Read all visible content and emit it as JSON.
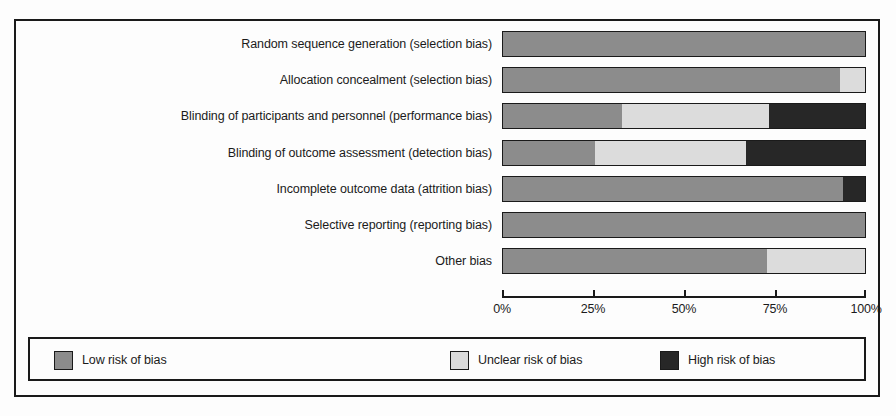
{
  "chart_data": {
    "type": "bar",
    "orientation": "horizontal",
    "stacked": true,
    "normalized_percent": true,
    "title": "",
    "xlabel": "",
    "ylabel": "",
    "xlim": [
      0,
      100
    ],
    "grid": false,
    "legend_position": "bottom",
    "categories": [
      "Random sequence generation (selection bias)",
      "Allocation concealment (selection bias)",
      "Blinding of participants and personnel (performance bias)",
      "Blinding of outcome assessment (detection bias)",
      "Incomplete outcome data (attrition bias)",
      "Selective reporting (reporting bias)",
      "Other bias"
    ],
    "series": [
      {
        "name": "Low risk of bias",
        "color": "#8c8c8c",
        "values": [
          100,
          93,
          33,
          25.5,
          94,
          100,
          73
        ]
      },
      {
        "name": "Unclear risk of bias",
        "color": "#dcdcdc",
        "values": [
          0,
          7,
          40.5,
          41.5,
          0,
          0,
          27
        ]
      },
      {
        "name": "High risk of bias",
        "color": "#272727",
        "values": [
          0,
          0,
          26.5,
          33,
          6,
          0,
          0
        ]
      }
    ],
    "xticks": [
      0,
      25,
      50,
      75,
      100
    ],
    "xtick_labels": [
      "0%",
      "25%",
      "50%",
      "75%",
      "100%"
    ]
  },
  "legend": {
    "entries": [
      {
        "label": "Low risk of bias",
        "color": "#8c8c8c"
      },
      {
        "label": "Unclear risk of bias",
        "color": "#dcdcdc"
      },
      {
        "label": "High risk of bias",
        "color": "#272727"
      }
    ]
  }
}
